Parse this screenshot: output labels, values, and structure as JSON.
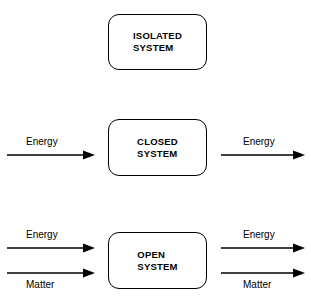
{
  "diagram": {
    "background_color": "#ffffff",
    "stroke_color": "#000000",
    "rows": [
      {
        "id": "isolated",
        "box_label": "ISOLATED\nSYSTEM",
        "inputs": [],
        "outputs": []
      },
      {
        "id": "closed",
        "box_label": "CLOSED\nSYSTEM",
        "inputs": [
          {
            "label": "Energy",
            "label_position": "above"
          }
        ],
        "outputs": [
          {
            "label": "Energy",
            "label_position": "above"
          }
        ]
      },
      {
        "id": "open",
        "box_label": "OPEN\nSYSTEM",
        "inputs": [
          {
            "label": "Energy",
            "label_position": "above"
          },
          {
            "label": "Matter",
            "label_position": "below"
          }
        ],
        "outputs": [
          {
            "label": "Energy",
            "label_position": "above"
          },
          {
            "label": "Matter",
            "label_position": "below"
          }
        ]
      }
    ]
  }
}
